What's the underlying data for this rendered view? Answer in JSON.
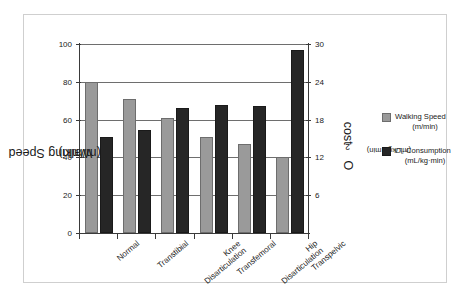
{
  "chart_data": {
    "type": "bar",
    "title": "",
    "categories": [
      "Normal",
      "Transtibial",
      "Knee Disarticulation",
      "Transfemoral",
      "Hip Disarticulation",
      "Transpelvic"
    ],
    "category_lines": [
      [
        "Normal"
      ],
      [
        "Transtibial"
      ],
      [
        "Knee",
        "Disarticulation"
      ],
      [
        "Transfemoral"
      ],
      [
        "Hip",
        "Disarticulation"
      ],
      [
        "Transpelvic"
      ]
    ],
    "series": [
      {
        "name": "Walking Speed",
        "units": "(m/min)",
        "axis": "left",
        "color": "#9a9a9a",
        "values": [
          80,
          71,
          61,
          51,
          47,
          40
        ]
      },
      {
        "name": "O2 Consumption",
        "units": "(mL/kg·min)",
        "axis": "right",
        "color": "#262626",
        "values": [
          15.3,
          16.3,
          19.8,
          20.3,
          20.2,
          29.0
        ]
      }
    ],
    "xlabel": "",
    "ylabel_left": "Walking Speed",
    "ylabel_left_units": "(m/min)",
    "ylabel_right": "O₂ cost",
    "ylabel_right_units": "(mL/kg · min)",
    "ylim_left": [
      0,
      100
    ],
    "ylim_right": [
      0,
      30
    ],
    "yticks_left": [
      0,
      20,
      40,
      60,
      80,
      100
    ],
    "yticks_right": [
      6,
      12,
      18,
      24,
      30
    ],
    "grid": true,
    "legend_position": "right"
  },
  "legend": {
    "entries": [
      {
        "name": "Walking Speed",
        "units": "(m/min)",
        "swatch": "#9a9a9a"
      },
      {
        "name": "O₂ Consumption",
        "units": "(mL/kg·min)",
        "swatch": "#262626"
      }
    ]
  },
  "axis_titles": {
    "left_line1": "Walking Speed",
    "left_line2": "(m/min)",
    "right_line1": "O",
    "right_sub": "2",
    "right_line1b": " cost",
    "right_line2": "(mL/kg · min)"
  }
}
